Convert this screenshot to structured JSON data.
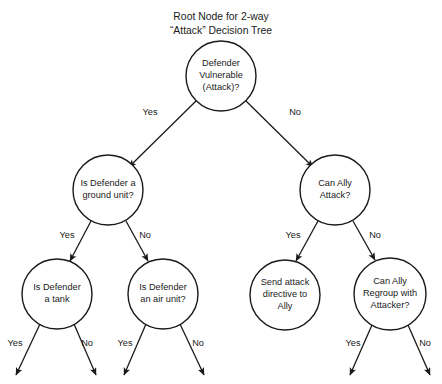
{
  "canvas": {
    "width": 442,
    "height": 384,
    "background": "#ffffff",
    "stroke_color": "#1a1a1a",
    "text_color": "#1a1a1a"
  },
  "title": {
    "line1": "Root Node for 2-way",
    "line2": "“Attack” Decision Tree"
  },
  "nodes": {
    "root": {
      "id": "defender-vulnerable",
      "cx": 221,
      "cy": 76,
      "r": 35,
      "lines": [
        "Defender",
        "Vulnerable",
        "(Attack)?"
      ]
    },
    "ground_unit": {
      "id": "is-defender-ground-unit",
      "cx": 108,
      "cy": 190,
      "r": 35,
      "lines": [
        "Is Defender a",
        "ground unit?"
      ]
    },
    "can_ally_attack": {
      "id": "can-ally-attack",
      "cx": 335,
      "cy": 190,
      "r": 35,
      "lines": [
        "Can Ally",
        "Attack?"
      ]
    },
    "is_tank": {
      "id": "is-defender-a-tank",
      "cx": 57,
      "cy": 294,
      "r": 35,
      "lines": [
        "Is Defender",
        "a tank"
      ]
    },
    "is_air_unit": {
      "id": "is-defender-air-unit",
      "cx": 163,
      "cy": 294,
      "r": 35,
      "lines": [
        "Is Defender",
        "an air unit?"
      ]
    },
    "send_attack": {
      "id": "send-attack-directive",
      "cx": 285,
      "cy": 295,
      "r": 35,
      "lines": [
        "Send attack",
        "directive to",
        "Ally"
      ]
    },
    "can_ally_regroup": {
      "id": "can-ally-regroup",
      "cx": 390,
      "cy": 294,
      "r": 36,
      "lines": [
        "Can Ally",
        "Regroup with",
        "Attacker?"
      ]
    }
  },
  "edges": [
    {
      "id": "root-yes",
      "from": "root",
      "to": "ground_unit",
      "label": "Yes",
      "label_x": 150,
      "label_y": 113,
      "x1": 196,
      "y1": 101,
      "x2": 129,
      "y2": 167
    },
    {
      "id": "root-no",
      "from": "root",
      "to": "can_ally_attack",
      "label": "No",
      "label_x": 295,
      "label_y": 113,
      "x1": 246,
      "y1": 101,
      "x2": 313,
      "y2": 167
    },
    {
      "id": "ground-yes",
      "from": "ground_unit",
      "to": "is_tank",
      "label": "Yes",
      "label_x": 67,
      "label_y": 236,
      "x1": 91,
      "y1": 221,
      "x2": 70,
      "y2": 261
    },
    {
      "id": "ground-no",
      "from": "ground_unit",
      "to": "is_air_unit",
      "label": "No",
      "label_x": 145,
      "label_y": 236,
      "x1": 126,
      "y1": 221,
      "x2": 148,
      "y2": 261
    },
    {
      "id": "ally-attack-yes",
      "from": "can_ally_attack",
      "to": "send_attack",
      "label": "Yes",
      "label_x": 293,
      "label_y": 236,
      "x1": 318,
      "y1": 221,
      "x2": 296,
      "y2": 261
    },
    {
      "id": "ally-attack-no",
      "from": "can_ally_attack",
      "to": "can_ally_regroup",
      "label": "No",
      "label_x": 375,
      "label_y": 236,
      "x1": 353,
      "y1": 221,
      "x2": 375,
      "y2": 260
    }
  ],
  "leaf_edges": [
    {
      "id": "tank-yes",
      "from": "is_tank",
      "label": "Yes",
      "label_x": 15,
      "label_y": 344,
      "x1": 40,
      "y1": 324,
      "x2": 16,
      "y2": 375
    },
    {
      "id": "tank-no",
      "from": "is_tank",
      "label": "No",
      "label_x": 87,
      "label_y": 344,
      "x1": 74,
      "y1": 324,
      "x2": 96,
      "y2": 375
    },
    {
      "id": "air-yes",
      "from": "is_air_unit",
      "label": "Yes",
      "label_x": 125,
      "label_y": 344,
      "x1": 146,
      "y1": 324,
      "x2": 124,
      "y2": 375
    },
    {
      "id": "air-no",
      "from": "is_air_unit",
      "label": "No",
      "label_x": 198,
      "label_y": 344,
      "x1": 180,
      "y1": 324,
      "x2": 204,
      "y2": 375
    },
    {
      "id": "regroup-yes",
      "from": "can_ally_regroup",
      "label": "Yes",
      "label_x": 353,
      "label_y": 344,
      "x1": 372,
      "y1": 325,
      "x2": 350,
      "y2": 375
    },
    {
      "id": "regroup-no",
      "from": "can_ally_regroup",
      "label": "No",
      "label_x": 425,
      "label_y": 344,
      "x1": 408,
      "y1": 325,
      "x2": 430,
      "y2": 375
    }
  ]
}
